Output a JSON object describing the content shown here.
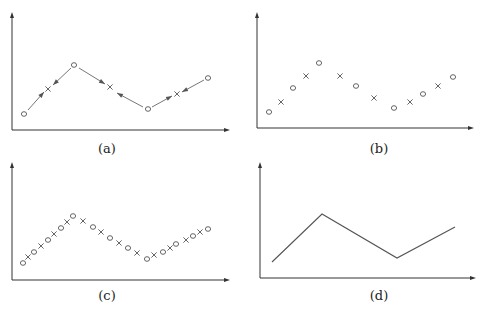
{
  "figure": {
    "captions": [
      "(a)",
      "(b)",
      "(c)",
      "(d)"
    ],
    "footer_text": ""
  },
  "chart_data": [
    {
      "type": "scatter",
      "panel": "(a)",
      "description": "Coarse points (o) with interpolated points (x); arrows point from each o toward neighboring x",
      "axes": {
        "origin": [
          12,
          130
        ],
        "x_end": 230,
        "y_top": 12
      },
      "points": [
        {
          "m": "o",
          "x": 24,
          "y": 114
        },
        {
          "m": "x",
          "x": 48,
          "y": 89
        },
        {
          "m": "o",
          "x": 74,
          "y": 65
        },
        {
          "m": "x",
          "x": 110,
          "y": 87
        },
        {
          "m": "o",
          "x": 148,
          "y": 109
        },
        {
          "m": "x",
          "x": 177,
          "y": 94
        },
        {
          "m": "o",
          "x": 208,
          "y": 78
        }
      ],
      "arrows": [
        {
          "from": [
            28,
            110
          ],
          "to": [
            44,
            92
          ]
        },
        {
          "from": [
            71,
            68
          ],
          "to": [
            53,
            85
          ]
        },
        {
          "from": [
            79,
            68
          ],
          "to": [
            105,
            84
          ]
        },
        {
          "from": [
            143,
            107
          ],
          "to": [
            117,
            93
          ]
        },
        {
          "from": [
            152,
            107
          ],
          "to": [
            172,
            96
          ]
        },
        {
          "from": [
            204,
            80
          ],
          "to": [
            182,
            92
          ]
        }
      ],
      "grid": false,
      "legend": null
    },
    {
      "type": "scatter",
      "panel": "(b)",
      "axes": {
        "origin": [
          257,
          128
        ],
        "x_end": 474,
        "y_top": 12
      },
      "points": [
        {
          "m": "o",
          "x": 269,
          "y": 112
        },
        {
          "m": "x",
          "x": 281,
          "y": 102
        },
        {
          "m": "o",
          "x": 293,
          "y": 88
        },
        {
          "m": "x",
          "x": 306,
          "y": 76
        },
        {
          "m": "o",
          "x": 319,
          "y": 63
        },
        {
          "m": "x",
          "x": 340,
          "y": 76
        },
        {
          "m": "o",
          "x": 356,
          "y": 86
        },
        {
          "m": "x",
          "x": 374,
          "y": 98
        },
        {
          "m": "o",
          "x": 394,
          "y": 108
        },
        {
          "m": "x",
          "x": 410,
          "y": 102
        },
        {
          "m": "o",
          "x": 423,
          "y": 94
        },
        {
          "m": "x",
          "x": 438,
          "y": 86
        },
        {
          "m": "o",
          "x": 453,
          "y": 77
        }
      ],
      "grid": false,
      "legend": null
    },
    {
      "type": "scatter",
      "panel": "(c)",
      "axes": {
        "origin": [
          12,
          280
        ],
        "x_end": 230,
        "y_top": 162
      },
      "points": [
        {
          "m": "o",
          "x": 23,
          "y": 263
        },
        {
          "m": "x",
          "x": 28,
          "y": 257
        },
        {
          "m": "o",
          "x": 34,
          "y": 252
        },
        {
          "m": "x",
          "x": 41,
          "y": 246
        },
        {
          "m": "o",
          "x": 48,
          "y": 240
        },
        {
          "m": "x",
          "x": 54,
          "y": 234
        },
        {
          "m": "o",
          "x": 61,
          "y": 228
        },
        {
          "m": "x",
          "x": 67,
          "y": 222
        },
        {
          "m": "o",
          "x": 73,
          "y": 216
        },
        {
          "m": "x",
          "x": 83,
          "y": 221
        },
        {
          "m": "o",
          "x": 93,
          "y": 227
        },
        {
          "m": "x",
          "x": 101,
          "y": 232
        },
        {
          "m": "o",
          "x": 110,
          "y": 238
        },
        {
          "m": "x",
          "x": 119,
          "y": 243
        },
        {
          "m": "o",
          "x": 128,
          "y": 248
        },
        {
          "m": "x",
          "x": 137,
          "y": 253
        },
        {
          "m": "o",
          "x": 147,
          "y": 259
        },
        {
          "m": "x",
          "x": 154,
          "y": 255
        },
        {
          "m": "o",
          "x": 163,
          "y": 252
        },
        {
          "m": "x",
          "x": 170,
          "y": 248
        },
        {
          "m": "o",
          "x": 176,
          "y": 244
        },
        {
          "m": "x",
          "x": 186,
          "y": 240
        },
        {
          "m": "o",
          "x": 193,
          "y": 236
        },
        {
          "m": "x",
          "x": 200,
          "y": 232
        },
        {
          "m": "o",
          "x": 208,
          "y": 229
        }
      ],
      "grid": false,
      "legend": null
    },
    {
      "type": "line",
      "panel": "(d)",
      "axes": {
        "origin": [
          260,
          278
        ],
        "x_end": 476,
        "y_top": 162
      },
      "points": [
        {
          "x": 272,
          "y": 262
        },
        {
          "x": 322,
          "y": 214
        },
        {
          "x": 397,
          "y": 258
        },
        {
          "x": 455,
          "y": 227
        }
      ],
      "grid": false,
      "legend": null
    }
  ]
}
